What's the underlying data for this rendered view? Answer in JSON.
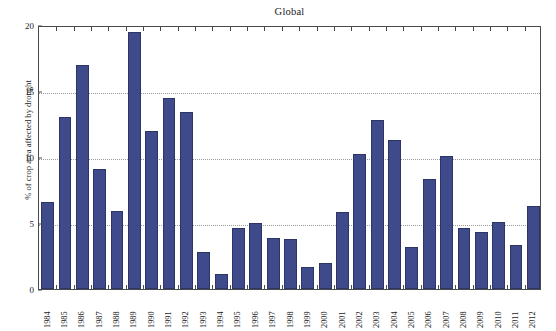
{
  "chart_data": {
    "type": "bar",
    "title": "Global",
    "xlabel": "",
    "ylabel": "% of crop area affected by drought",
    "ylim": [
      0,
      20
    ],
    "yticks": [
      0,
      5,
      10,
      15,
      20
    ],
    "grid": "horizontal-dotted",
    "legend": null,
    "bar_color": "#3f4a8a",
    "bar_edge_color": "#2d3566",
    "categories": [
      "1984",
      "1985",
      "1986",
      "1987",
      "1988",
      "1989",
      "1990",
      "1991",
      "1992",
      "1993",
      "1994",
      "1995",
      "1996",
      "1997",
      "1998",
      "1999",
      "2000",
      "2001",
      "2002",
      "2003",
      "2004",
      "2005",
      "2006",
      "2007",
      "2008",
      "2009",
      "2010",
      "2011",
      "2012"
    ],
    "values": [
      6.6,
      13.0,
      17.0,
      9.1,
      5.9,
      19.5,
      12.0,
      14.5,
      13.4,
      2.8,
      1.1,
      4.6,
      5.0,
      3.9,
      3.8,
      1.7,
      2.0,
      5.8,
      10.2,
      12.8,
      11.3,
      3.2,
      8.3,
      10.1,
      4.6,
      4.3,
      5.1,
      3.3,
      6.3
    ]
  }
}
